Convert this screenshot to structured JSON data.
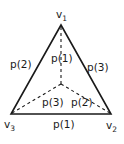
{
  "diagram": {
    "type": "triangle-with-centroid",
    "vertices": [
      {
        "id": "v1",
        "label": "v",
        "subscript": "1"
      },
      {
        "id": "v2",
        "label": "v",
        "subscript": "2"
      },
      {
        "id": "v3",
        "label": "v",
        "subscript": "3"
      }
    ],
    "edges": {
      "left": "p(2)",
      "right": "p(3)",
      "bottom": "p(1)"
    },
    "inner_edges": {
      "to_v1": "p(1)",
      "to_v3": "p(3)",
      "to_v2": "p(2)"
    },
    "colors": {
      "stroke": "#1a1a1a",
      "background": "#ffffff"
    }
  }
}
